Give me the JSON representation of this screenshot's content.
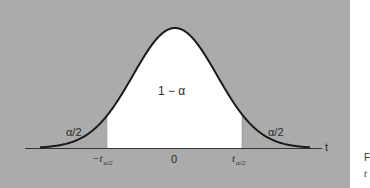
{
  "chart_data": {
    "type": "area",
    "title": "",
    "xlabel": "t",
    "ylabel": "",
    "x_ticks": [
      "-t α/2",
      "0",
      "t α/2"
    ],
    "regions": [
      {
        "name": "left tail",
        "label": "α/2",
        "fill": "#ababab"
      },
      {
        "name": "center",
        "label": "1 − α",
        "fill": "#ffffff"
      },
      {
        "name": "right tail",
        "label": "α/2",
        "fill": "#ababab"
      }
    ],
    "grid": false,
    "legend": null
  },
  "labels": {
    "center": "1 − α",
    "left_tail": "α/2",
    "right_tail": "α/2",
    "axis_t": "t",
    "tick_zero": "0",
    "tick_left_main": "−t",
    "tick_left_sub": "α/2",
    "tick_right_main": "t",
    "tick_right_sub": "α/2"
  },
  "caption": {
    "line1": "F",
    "line2": "t"
  },
  "colors": {
    "background": "#ababab",
    "center_fill": "#ffffff",
    "curve": "#1a1a1a"
  }
}
